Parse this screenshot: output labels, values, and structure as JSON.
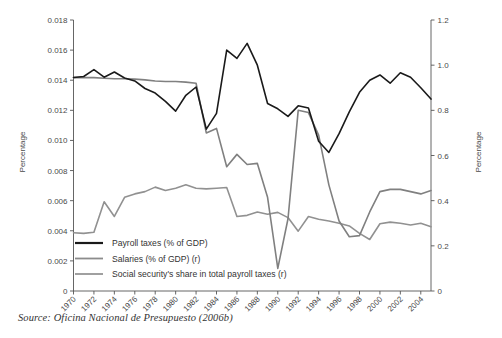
{
  "figure": {
    "source_note": "Source: Oficina Nacional de Presupuesto (2006b)",
    "left_axis_title": "Percentage",
    "right_axis_title": "Percentage"
  },
  "chart_data": {
    "type": "line",
    "title": "",
    "subtitle": "",
    "xlabel": "",
    "ylabel": "Percentage",
    "y2label": "Percentage",
    "grid": false,
    "legend_position": "inside-bottom-left",
    "xlim": [
      1970,
      2005
    ],
    "ylim": [
      0,
      0.018
    ],
    "y2lim": [
      0,
      1.2
    ],
    "ytick_labels": [
      "0",
      "0.002",
      "0.004",
      "0.006",
      "0.008",
      "0.010",
      "0.012",
      "0.014",
      "0.016",
      "0.018"
    ],
    "ytick_values": [
      0,
      0.002,
      0.004,
      0.006,
      0.008,
      0.01,
      0.012,
      0.014,
      0.016,
      0.018
    ],
    "y2tick_labels": [
      "0",
      "0.2",
      "0.4",
      "0.6",
      "0.8",
      "1.0",
      "1.2"
    ],
    "y2tick_values": [
      0,
      0.2,
      0.4,
      0.6,
      0.8,
      1.0,
      1.2
    ],
    "x": [
      1970,
      1971,
      1972,
      1973,
      1974,
      1975,
      1976,
      1977,
      1978,
      1979,
      1980,
      1981,
      1982,
      1983,
      1984,
      1985,
      1986,
      1987,
      1988,
      1989,
      1990,
      1991,
      1992,
      1993,
      1994,
      1995,
      1996,
      1997,
      1998,
      1999,
      2000,
      2001,
      2002,
      2003,
      2004,
      2005
    ],
    "xtick_labels": [
      "1970",
      "1972",
      "1974",
      "1976",
      "1978",
      "1980",
      "1982",
      "1984",
      "1986",
      "1988",
      "1990",
      "1992",
      "1994",
      "1996",
      "1998",
      "2000",
      "2002",
      "2004"
    ],
    "xtick_values": [
      1970,
      1972,
      1974,
      1976,
      1978,
      1980,
      1982,
      1984,
      1986,
      1988,
      1990,
      1992,
      1994,
      1996,
      1998,
      2000,
      2002,
      2004
    ],
    "series": [
      {
        "name": "Payroll taxes (% of GDP)",
        "axis": "left",
        "color": "#1a1a1a",
        "width": 1.6,
        "values": [
          0.01418,
          0.01425,
          0.0147,
          0.0142,
          0.01455,
          0.01415,
          0.01395,
          0.01345,
          0.01315,
          0.0126,
          0.01195,
          0.013,
          0.01355,
          0.01075,
          0.0118,
          0.016,
          0.01545,
          0.01645,
          0.015,
          0.01245,
          0.0121,
          0.0116,
          0.0123,
          0.01215,
          0.00995,
          0.0092,
          0.01045,
          0.0119,
          0.0132,
          0.014,
          0.01435,
          0.0138,
          0.0145,
          0.0142,
          0.0135,
          0.01275
        ]
      },
      {
        "name": "Salaries (% of GDP) (r)",
        "axis": "right",
        "color": "#808080",
        "width": 1.6,
        "values": [
          0.945,
          0.945,
          0.945,
          0.942,
          0.94,
          0.94,
          0.938,
          0.935,
          0.93,
          0.928,
          0.928,
          0.925,
          0.92,
          0.7,
          0.72,
          0.55,
          0.605,
          0.56,
          0.565,
          0.415,
          0.1,
          0.32,
          0.8,
          0.79,
          0.69,
          0.47,
          0.31,
          0.24,
          0.245,
          0.35,
          0.44,
          0.45,
          0.45,
          0.44,
          0.43,
          0.445
        ]
      },
      {
        "name": "Social security's share in total payroll taxes (r)",
        "axis": "right",
        "color": "#919191",
        "width": 1.6,
        "values": [
          0.258,
          0.255,
          0.26,
          0.395,
          0.33,
          0.415,
          0.43,
          0.44,
          0.46,
          0.445,
          0.455,
          0.47,
          0.455,
          0.452,
          0.455,
          0.458,
          0.33,
          0.335,
          0.35,
          0.34,
          0.348,
          0.325,
          0.265,
          0.33,
          0.318,
          0.31,
          0.3,
          0.288,
          0.255,
          0.228,
          0.298,
          0.305,
          0.3,
          0.292,
          0.3,
          0.285
        ]
      }
    ],
    "legend": [
      {
        "label": "Payroll taxes (% of GDP)",
        "color": "#1a1a1a"
      },
      {
        "label": "Salaries (% of GDP) (r)",
        "color": "#8c8c8c"
      },
      {
        "label": "Social security's share in total payroll taxes (r)",
        "color": "#969696"
      }
    ]
  }
}
